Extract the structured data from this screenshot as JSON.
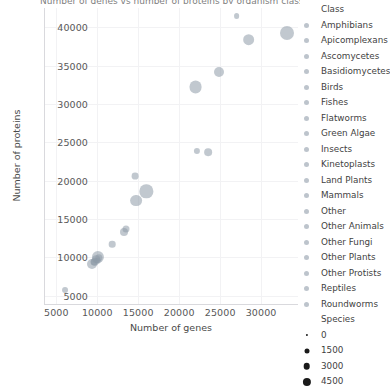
{
  "chart_data": {
    "type": "scatter",
    "title": "Number of genes vs number of proteins by organism class",
    "xlabel": "Number of genes",
    "ylabel": "Number of proteins",
    "xlim": [
      3500,
      34500
    ],
    "ylim": [
      3800,
      42500
    ],
    "xticks": [
      5000,
      10000,
      15000,
      20000,
      25000,
      30000
    ],
    "yticks": [
      5000,
      10000,
      15000,
      20000,
      25000,
      30000,
      35000,
      40000
    ],
    "grid": true,
    "legend_position": "right",
    "color_legend": {
      "title": "Class",
      "entries": [
        "Amphibians",
        "Apicomplexans",
        "Ascomycetes",
        "Basidiomycetes",
        "Birds",
        "Fishes",
        "Flatworms",
        "Green Algae",
        "Insects",
        "Kinetoplasts",
        "Land Plants",
        "Mammals",
        "Other",
        "Other Animals",
        "Other Fungi",
        "Other Plants",
        "Other Protists",
        "Reptiles",
        "Roundworms"
      ]
    },
    "size_legend": {
      "title": "Species",
      "values": [
        "0",
        "1500",
        "3000",
        "4500"
      ],
      "sizes_px": [
        2.2,
        5.0,
        6.6,
        8.2
      ]
    },
    "marker_color": "#8e9aa8",
    "points": [
      {
        "class": "Other Protists",
        "genes": 6100,
        "proteins": 5700,
        "species": 120
      },
      {
        "class": "Ascomycetes",
        "genes": 9300,
        "proteins": 9150,
        "species": 900
      },
      {
        "class": "Basidiomycetes",
        "genes": 9700,
        "proteins": 9450,
        "species": 520
      },
      {
        "class": "Other Fungi",
        "genes": 9850,
        "proteins": 9750,
        "species": 340
      },
      {
        "class": "Green Algae",
        "genes": 10050,
        "proteins": 10050,
        "species": 1600
      },
      {
        "class": "Kinetoplasts",
        "genes": 10200,
        "proteins": 9900,
        "species": 300
      },
      {
        "class": "Apicomplexans",
        "genes": 9550,
        "proteins": 9400,
        "species": 260
      },
      {
        "class": "Other",
        "genes": 10100,
        "proteins": 9600,
        "species": 180
      },
      {
        "class": "Flatworms",
        "genes": 11800,
        "proteins": 11700,
        "species": 200
      },
      {
        "class": "Roundworms",
        "genes": 13300,
        "proteins": 13350,
        "species": 420
      },
      {
        "class": "Other Animals",
        "genes": 13500,
        "proteins": 13700,
        "species": 260
      },
      {
        "class": "Insects",
        "genes": 14700,
        "proteins": 17400,
        "species": 1500
      },
      {
        "class": "Other Plants",
        "genes": 14600,
        "proteins": 20600,
        "species": 230
      },
      {
        "class": "Land Plants",
        "genes": 16000,
        "proteins": 18600,
        "species": 2100
      },
      {
        "class": "Fishes",
        "genes": 22000,
        "proteins": 32200,
        "species": 1900
      },
      {
        "class": "Amphibians",
        "genes": 22200,
        "proteins": 23900,
        "species": 150
      },
      {
        "class": "Reptiles",
        "genes": 23500,
        "proteins": 23700,
        "species": 380
      },
      {
        "class": "Birds",
        "genes": 24800,
        "proteins": 34200,
        "species": 900
      },
      {
        "class": "Other Animals 2",
        "genes": 27000,
        "proteins": 41400,
        "species": 110
      },
      {
        "class": "Mammals",
        "genes": 28500,
        "proteins": 38400,
        "species": 1450
      },
      {
        "class": "Mammals 2",
        "genes": 33200,
        "proteins": 39300,
        "species": 2400
      }
    ]
  }
}
